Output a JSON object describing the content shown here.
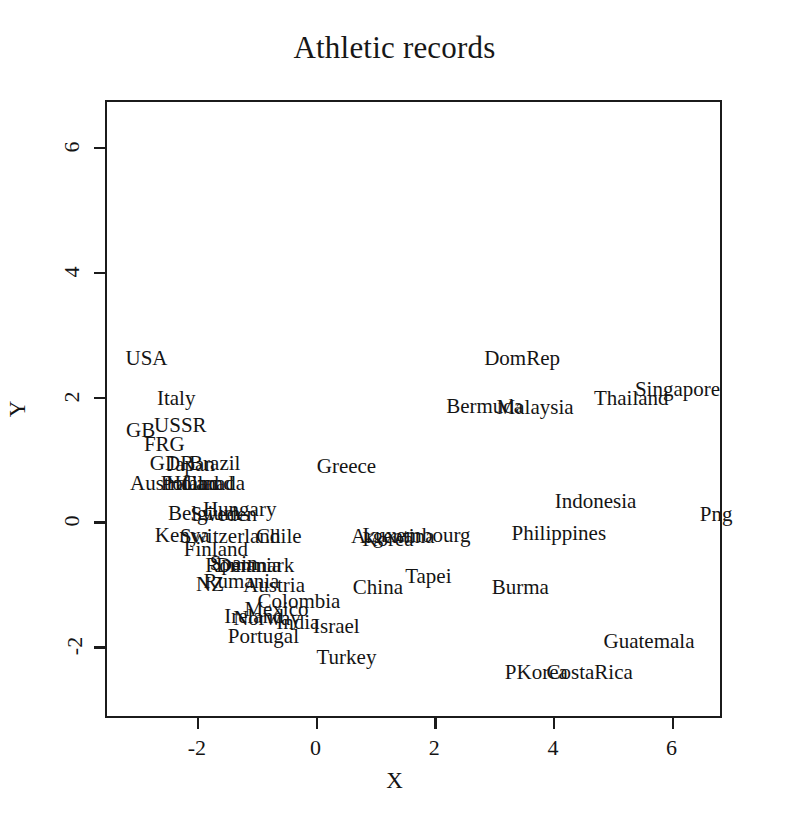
{
  "chart_data": {
    "type": "scatter",
    "title": "Athletic records",
    "xlabel": "X",
    "ylabel": "Y",
    "xlim": [
      -3.55,
      6.85
    ],
    "ylim": [
      -3.15,
      6.75
    ],
    "grid": false,
    "legend": null,
    "point_marker": "text-label",
    "xticks": [
      -2,
      0,
      2,
      4,
      6
    ],
    "yticks": [
      -2,
      0,
      2,
      4,
      6
    ],
    "xticklabels": [
      "-2",
      "0",
      "2",
      "4",
      "6"
    ],
    "yticklabels": [
      "-2",
      "0",
      "2",
      "4",
      "6"
    ],
    "points": [
      {
        "label": "USA",
        "x": -2.85,
        "y": 2.62
      },
      {
        "label": "Italy",
        "x": -2.35,
        "y": 1.97
      },
      {
        "label": "GB",
        "x": -2.95,
        "y": 1.47
      },
      {
        "label": "USSR",
        "x": -2.28,
        "y": 1.55
      },
      {
        "label": "FRG",
        "x": -2.55,
        "y": 1.24
      },
      {
        "label": "GDR",
        "x": -2.42,
        "y": 0.94
      },
      {
        "label": "Japan",
        "x": -2.1,
        "y": 0.92
      },
      {
        "label": "Brazil",
        "x": -1.7,
        "y": 0.94
      },
      {
        "label": "Australia",
        "x": -2.48,
        "y": 0.62
      },
      {
        "label": "Poland",
        "x": -2.12,
        "y": 0.62
      },
      {
        "label": "Holland",
        "x": -1.95,
        "y": 0.62
      },
      {
        "label": "Canada",
        "x": -1.72,
        "y": 0.62
      },
      {
        "label": "Greece",
        "x": 0.52,
        "y": 0.88
      },
      {
        "label": "Belgium",
        "x": -1.88,
        "y": 0.13
      },
      {
        "label": "Sweden",
        "x": -1.55,
        "y": 0.12
      },
      {
        "label": "Hungary",
        "x": -1.28,
        "y": 0.2
      },
      {
        "label": "Kenya",
        "x": -2.25,
        "y": -0.22
      },
      {
        "label": "Switzerland",
        "x": -1.44,
        "y": -0.24
      },
      {
        "label": "Chile",
        "x": -0.62,
        "y": -0.24
      },
      {
        "label": "Argentina",
        "x": 1.3,
        "y": -0.24
      },
      {
        "label": "Korea",
        "x": 1.22,
        "y": -0.28
      },
      {
        "label": "Luxembourg",
        "x": 1.7,
        "y": -0.22
      },
      {
        "label": "Finland",
        "x": -1.68,
        "y": -0.44
      },
      {
        "label": "Spain",
        "x": -1.38,
        "y": -0.67
      },
      {
        "label": "Romania",
        "x": -1.22,
        "y": -0.7
      },
      {
        "label": "Denmark",
        "x": -1.02,
        "y": -0.7
      },
      {
        "label": "NZ",
        "x": -1.78,
        "y": -1.0
      },
      {
        "label": "Rumania",
        "x": -1.25,
        "y": -0.95
      },
      {
        "label": "Austria",
        "x": -0.7,
        "y": -1.02
      },
      {
        "label": "China",
        "x": 1.05,
        "y": -1.05
      },
      {
        "label": "Tapei",
        "x": 1.9,
        "y": -0.88
      },
      {
        "label": "Burma",
        "x": 3.45,
        "y": -1.05
      },
      {
        "label": "Colombia",
        "x": -0.28,
        "y": -1.28
      },
      {
        "label": "Mexico",
        "x": -0.66,
        "y": -1.4
      },
      {
        "label": "Ireland",
        "x": -1.04,
        "y": -1.52
      },
      {
        "label": "Norway",
        "x": -0.82,
        "y": -1.55
      },
      {
        "label": "India",
        "x": -0.3,
        "y": -1.62
      },
      {
        "label": "Israel",
        "x": 0.35,
        "y": -1.68
      },
      {
        "label": "Portugal",
        "x": -0.88,
        "y": -1.83
      },
      {
        "label": "Turkey",
        "x": 0.52,
        "y": -2.18
      },
      {
        "label": "DomRep",
        "x": 3.48,
        "y": 2.62
      },
      {
        "label": "Singapore",
        "x": 6.1,
        "y": 2.12
      },
      {
        "label": "Thailand",
        "x": 5.32,
        "y": 1.98
      },
      {
        "label": "Bermuda",
        "x": 2.85,
        "y": 1.85
      },
      {
        "label": "Malaysia",
        "x": 3.7,
        "y": 1.83
      },
      {
        "label": "Indonesia",
        "x": 4.72,
        "y": 0.32
      },
      {
        "label": "Philippines",
        "x": 4.1,
        "y": -0.18
      },
      {
        "label": "Png",
        "x": 6.75,
        "y": 0.12
      },
      {
        "label": "Guatemala",
        "x": 5.62,
        "y": -1.92
      },
      {
        "label": "PKorea",
        "x": 3.72,
        "y": -2.42
      },
      {
        "label": "CostaRica",
        "x": 4.62,
        "y": -2.42
      }
    ]
  }
}
